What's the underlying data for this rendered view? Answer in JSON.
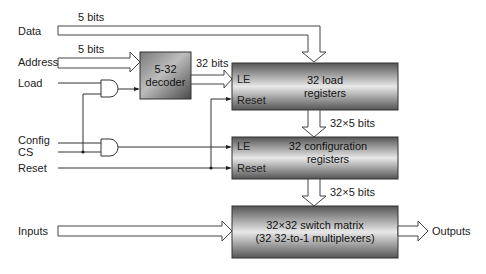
{
  "inputs": {
    "data": "Data",
    "address": "Address",
    "load": "Load",
    "config": "Config",
    "cs": "CS",
    "reset": "Reset",
    "inputs": "Inputs"
  },
  "bus_labels": {
    "data_width": "5 bits",
    "address_width": "5 bits",
    "decoder_out": "32 bits",
    "load_to_config": "32×5 bits",
    "config_to_switch": "32×5 bits"
  },
  "blocks": {
    "decoder": {
      "line1": "5-32",
      "line2": "decoder"
    },
    "load_registers": {
      "line1": "32 load",
      "line2": "registers",
      "pin_le": "LE",
      "pin_reset": "Reset"
    },
    "config_registers": {
      "line1": "32 configuration",
      "line2": "registers",
      "pin_le": "LE",
      "pin_reset": "Reset"
    },
    "switch_matrix": {
      "line1": "32×32 switch matrix",
      "line2": "(32 32-to-1 multiplexers)"
    }
  },
  "outputs": {
    "label": "Outputs"
  }
}
